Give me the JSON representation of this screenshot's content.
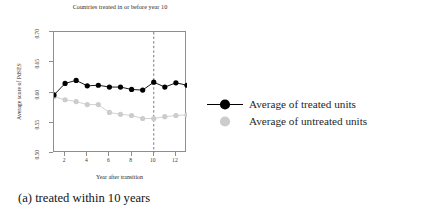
{
  "figure": {
    "caption": "(a) treated within 10 years"
  },
  "legend": {
    "position": "right",
    "items": [
      {
        "label": "Average of treated units",
        "marker": "filled-circle-with-line",
        "color": "#000000"
      },
      {
        "label": "Average of untreated units",
        "marker": "filled-circle",
        "color": "#cccccc"
      }
    ]
  },
  "chart_data": {
    "type": "line",
    "title": "Countries treated in or before year 10",
    "xlabel": "Year after transition",
    "ylabel": "Average score of PdSES",
    "x": [
      1,
      2,
      3,
      4,
      5,
      6,
      7,
      8,
      9,
      10,
      11,
      12,
      13
    ],
    "xlim": [
      1,
      13
    ],
    "ylim": [
      0.5,
      0.7
    ],
    "xticks": [
      2,
      4,
      6,
      8,
      10,
      12
    ],
    "xtick_labels": [
      "2",
      "4",
      "6",
      "8",
      "10",
      "12"
    ],
    "yticks": [
      0.5,
      0.55,
      0.6,
      0.65,
      0.7
    ],
    "ytick_labels": [
      "0.50",
      "0.55",
      "0.60",
      "0.65",
      "0.70"
    ],
    "grid": false,
    "series": [
      {
        "name": "Average of treated units",
        "color": "#000000",
        "values": [
          0.596,
          0.615,
          0.62,
          0.611,
          0.612,
          0.609,
          0.609,
          0.605,
          0.604,
          0.617,
          0.609,
          0.616,
          0.612
        ]
      },
      {
        "name": "Average of untreated units",
        "color": "#cccccc",
        "values": [
          0.593,
          0.588,
          0.585,
          0.58,
          0.58,
          0.567,
          0.564,
          0.562,
          0.557,
          0.557,
          0.56,
          0.562,
          0.563
        ]
      }
    ],
    "annotations": [
      {
        "type": "vline",
        "x": 10,
        "style": "dashed",
        "color": "#555555"
      }
    ]
  }
}
